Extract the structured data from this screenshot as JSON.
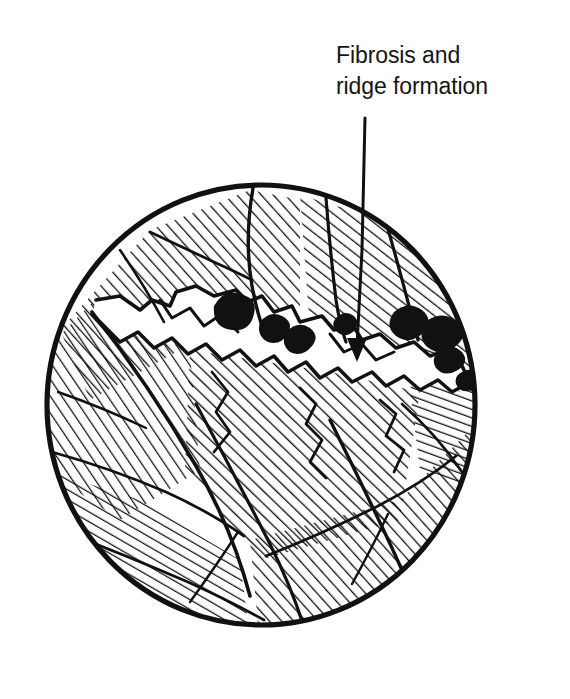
{
  "figure": {
    "name": "fibrosis-ridge-formation-cross-section",
    "kind": "hand-drawn-line-illustration",
    "background_color": "#ffffff",
    "ink_color": "#111111"
  },
  "annotation": {
    "line_1": "Fibrosis and",
    "line_2": "ridge formation",
    "text_left_px": 336,
    "text_top_px": 40,
    "font_size_px": 23,
    "leader": {
      "icon": "arrow-down-icon",
      "start_x": 365,
      "start_y": 118,
      "end_x": 357,
      "end_y": 358,
      "stroke_width": 3
    }
  },
  "specimen": {
    "label": "circular-cross-section",
    "center_x": 261,
    "center_y": 405,
    "radius_x": 217,
    "radius_y": 223,
    "outline_stroke_width": 5,
    "hatch_stroke_width": 2.4,
    "septa_stroke_width": 3.4,
    "regions": [
      {
        "name": "upper-left-parenchyma",
        "hatch_angle_deg": -42
      },
      {
        "name": "upper-right-parenchyma",
        "hatch_angle_deg": -52
      },
      {
        "name": "left-parenchyma",
        "hatch_angle_deg": -38
      },
      {
        "name": "central-nodule",
        "hatch_angle_deg": -46
      },
      {
        "name": "lower-left-parenchyma",
        "hatch_angle_deg": -58
      },
      {
        "name": "lower-right-parenchyma",
        "hatch_angle_deg": -40
      },
      {
        "name": "right-margin-parenchyma",
        "hatch_angle_deg": -62
      }
    ],
    "fibrosis_band": {
      "name": "fibrotic-ridge-band",
      "description": "irregular jagged pale band crossing the upper third of the section",
      "dense_deposits": [
        {
          "name": "dark-deposit-1",
          "cx": 232,
          "cy": 318,
          "r": 17
        },
        {
          "name": "dark-deposit-2",
          "cx": 272,
          "cy": 330,
          "r": 12
        },
        {
          "name": "dark-deposit-3",
          "cx": 300,
          "cy": 340,
          "r": 13
        },
        {
          "name": "dark-deposit-4",
          "cx": 345,
          "cy": 325,
          "r": 10
        },
        {
          "name": "dark-deposit-5",
          "cx": 410,
          "cy": 322,
          "r": 15
        },
        {
          "name": "dark-deposit-6",
          "cx": 444,
          "cy": 333,
          "r": 16
        },
        {
          "name": "dark-deposit-7",
          "cx": 455,
          "cy": 360,
          "r": 12
        }
      ]
    }
  }
}
